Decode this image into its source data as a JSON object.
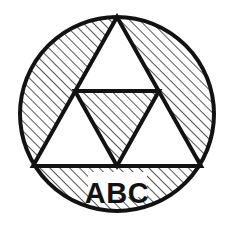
{
  "figure": {
    "kind": "geometric-diagram",
    "label": "ABC",
    "background_color": "#ffffff",
    "stroke_color": "#121212",
    "hatch_color": "#2b2b2b",
    "fill_color": "#ffffff",
    "circle": {
      "center_x": 117,
      "center_y": 114,
      "radius": 97,
      "stroke_width": 4
    },
    "triangle": {
      "apex_x": 117,
      "apex_y": 17,
      "left_x": 33,
      "left_y": 166,
      "right_x": 201,
      "right_y": 166,
      "stroke_width": 4,
      "midline_y": 91
    },
    "hatching": {
      "angle_degrees": 45,
      "spacing_px": 7,
      "line_width": 1.6
    },
    "regions": [
      {
        "name": "outer-segment-hatch",
        "filled": "hatched"
      },
      {
        "name": "top-sub-triangle",
        "filled": "white"
      },
      {
        "name": "left-sub-triangle",
        "filled": "white"
      },
      {
        "name": "right-sub-triangle",
        "filled": "white"
      },
      {
        "name": "center-inverted-sub-triangle",
        "filled": "hatched"
      }
    ],
    "label_position": {
      "x": 117,
      "y": 193
    }
  }
}
